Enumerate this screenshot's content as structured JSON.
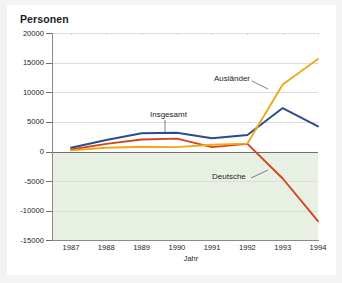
{
  "chart_data": {
    "type": "line",
    "title": "Personen",
    "xlabel": "Jahr",
    "ylabel": "Personen",
    "x": [
      1987,
      1988,
      1989,
      1990,
      1991,
      1992,
      1993,
      1994
    ],
    "xtick_labels": [
      "1987",
      "1988",
      "1989",
      "1990",
      "1991",
      "1992",
      "1993",
      "1994"
    ],
    "ytick_labels": [
      "20000",
      "15000",
      "10000",
      "5000",
      "0",
      "-5000",
      "-10000",
      "-15000"
    ],
    "yticks": [
      20000,
      15000,
      10000,
      5000,
      0,
      -5000,
      -10000,
      -15000
    ],
    "ylim": [
      -15000,
      20000
    ],
    "xlim": [
      1987,
      1994
    ],
    "grid": true,
    "legend": "inline-annotations",
    "series": [
      {
        "name": "Insgesamt",
        "color": "#2b4c8c",
        "values": [
          600,
          1900,
          3050,
          3150,
          2200,
          2750,
          7300,
          4200
        ]
      },
      {
        "name": "Deutsche",
        "color": "#d2451e",
        "values": [
          300,
          1250,
          2000,
          2150,
          700,
          1250,
          -4600,
          -11800
        ]
      },
      {
        "name": "Ausländer",
        "color": "#f0a818",
        "values": [
          150,
          600,
          750,
          700,
          1100,
          1300,
          11300,
          15600
        ]
      }
    ],
    "annotations": [
      {
        "text": "Insgesamt",
        "series": "Insgesamt"
      },
      {
        "text": "Ausländer",
        "series": "Ausländer"
      },
      {
        "text": "Deutsche",
        "series": "Deutsche"
      }
    ],
    "colors": {
      "insgesamt": "#2b4c8c",
      "deutsche": "#d2451e",
      "auslaender": "#f0a818",
      "negative_band": "#e8f0e4",
      "gridline": "#dcdcdc",
      "axis": "#6e6e6e"
    }
  }
}
